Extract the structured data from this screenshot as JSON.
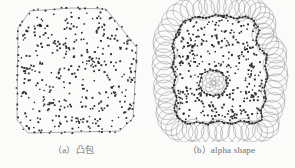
{
  "figure": {
    "background_color": "#fbfbfa",
    "ink_color": "#2b2b2b",
    "hull_line_color": "#8d8d8d",
    "circle_color": "#9a9a9a",
    "caption_color": "#6f6f6f",
    "width": 295,
    "height": 168
  },
  "panels": [
    {
      "id": "a",
      "caption": "（a）凸包",
      "caption_index": "(a)",
      "caption_text": "凸包",
      "type": "convex-hull",
      "point_count": 300,
      "hull_vertices": [
        [
          30,
          11
        ],
        [
          72,
          8
        ],
        [
          106,
          9
        ],
        [
          137,
          48
        ],
        [
          133,
          118
        ],
        [
          120,
          131
        ],
        [
          28,
          133
        ],
        [
          17,
          120
        ],
        [
          18,
          28
        ]
      ]
    },
    {
      "id": "b",
      "caption": "（b）alpha shape",
      "caption_index": "(b)",
      "caption_text": "alpha shape",
      "type": "alpha-shape",
      "point_count": 300,
      "alpha_radius": 11,
      "boundary_circle_count": 34,
      "inner_hole_circle_count": 7,
      "outer_boundary": [
        [
          35,
          22
        ],
        [
          47,
          17
        ],
        [
          58,
          18
        ],
        [
          68,
          15
        ],
        [
          79,
          16
        ],
        [
          89,
          19
        ],
        [
          98,
          16
        ],
        [
          106,
          21
        ],
        [
          111,
          30
        ],
        [
          108,
          40
        ],
        [
          112,
          49
        ],
        [
          119,
          55
        ],
        [
          117,
          66
        ],
        [
          120,
          76
        ],
        [
          116,
          88
        ],
        [
          118,
          99
        ],
        [
          113,
          110
        ],
        [
          114,
          120
        ],
        [
          104,
          124
        ],
        [
          93,
          121
        ],
        [
          82,
          124
        ],
        [
          71,
          121
        ],
        [
          60,
          124
        ],
        [
          49,
          122
        ],
        [
          39,
          124
        ],
        [
          30,
          118
        ],
        [
          26,
          108
        ],
        [
          29,
          98
        ],
        [
          25,
          88
        ],
        [
          28,
          77
        ],
        [
          24,
          67
        ],
        [
          27,
          56
        ],
        [
          24,
          46
        ],
        [
          28,
          35
        ]
      ],
      "inner_hole": [
        [
          54,
          74
        ],
        [
          62,
          70
        ],
        [
          71,
          71
        ],
        [
          78,
          77
        ],
        [
          79,
          86
        ],
        [
          74,
          94
        ],
        [
          65,
          96
        ],
        [
          56,
          93
        ],
        [
          51,
          85
        ]
      ]
    }
  ],
  "chart_data": {
    "type": "scatter",
    "title": "",
    "xlabel": "",
    "ylabel": "",
    "grid": false,
    "legend": null,
    "series": [
      {
        "name": "point-set-convex-hull",
        "panel": "a",
        "marker": "square",
        "color": "#2b2b2b",
        "n": 300
      },
      {
        "name": "point-set-alpha-shape",
        "panel": "b",
        "marker": "square",
        "color": "#2b2b2b",
        "n": 300
      }
    ]
  }
}
